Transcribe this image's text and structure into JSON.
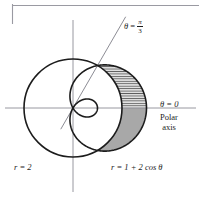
{
  "figure": {
    "background_color": "#ffffff",
    "curve_color": "#1c1c1c",
    "axis_color": "#8c8c95",
    "shade_fill_color": "#a8a8a8",
    "hatch_fill_color": "#d9d9d9",
    "hatch_line_color": "#3a3a3a",
    "frame_line_color": "#9a9aa2"
  },
  "labels": {
    "theta_pi_over_three": {
      "theta": "θ",
      "equals": " = ",
      "numerator": "π",
      "denominator": "3"
    },
    "theta_zero": "θ = 0",
    "polar_axis_line1": "Polar",
    "polar_axis_line2": "axis",
    "circle_equation": "r = 2",
    "limacon_equation": "r = 1 + 2 cos θ"
  },
  "chart_data": {
    "type": "line",
    "coordinate_system": "polar",
    "xlabel": "Polar axis",
    "ylabel": "",
    "origin_px": {
      "x": 73,
      "y": 108
    },
    "scale_px_per_unit": 24.5,
    "xlim": [
      -2.35,
      3.35
    ],
    "ylim": [
      -2.2,
      2.4
    ],
    "grid": false,
    "legend": "none",
    "series": [
      {
        "name": "r = 1 + 2 cos θ",
        "type": "polar-curve",
        "equation": "r = 1 + 2*cos(theta)",
        "a": 1,
        "b": 2,
        "curve_class": "limacon-with-inner-loop",
        "max_r": 3,
        "min_r": -1,
        "r_at_theta_0": 3,
        "r_at_theta_pi_over_3": 2,
        "r_at_theta_pi_over_2": 1,
        "r_at_theta_pi": -1,
        "stroke": "#1c1c1c",
        "stroke_width": 1.6
      },
      {
        "name": "r = 2",
        "type": "circle",
        "equation": "r = 2",
        "radius": 2,
        "center": [
          0,
          0
        ],
        "stroke": "#1c1c1c",
        "stroke_width": 1.6
      },
      {
        "name": "θ = π/3",
        "type": "ray",
        "angle_degrees": 60,
        "angle_radians": "π/3",
        "stroke": "#6e6e78",
        "stroke_width": 0.8
      },
      {
        "name": "θ = 0 (polar axis)",
        "type": "ray",
        "angle_degrees": 0,
        "angle_radians": "0",
        "stroke": "#8c8c95",
        "stroke_width": 0.8
      }
    ],
    "regions": [
      {
        "name": "hatched-region",
        "description": "Between circle r = 2 and limacon r = 1 + 2 cos θ, for θ from 0 to π/3",
        "theta_from": 0,
        "theta_to": 1.0471975512,
        "theta_to_label": "π/3",
        "fill": "#d9d9d9",
        "pattern": "horizontal-hatch"
      },
      {
        "name": "solid-shaded-region",
        "description": "Between circle r = 2 and limacon r = 1 + 2 cos θ, for θ from -π/3 to 0",
        "theta_from": -1.0471975512,
        "theta_to": 0,
        "fill": "#a8a8a8",
        "pattern": "solid"
      }
    ],
    "intersection_points": [
      {
        "theta": "π/3",
        "r": 2,
        "x": 1.0,
        "y": 1.7320508
      },
      {
        "theta": "-π/3",
        "r": 2,
        "x": 1.0,
        "y": -1.7320508
      }
    ]
  }
}
